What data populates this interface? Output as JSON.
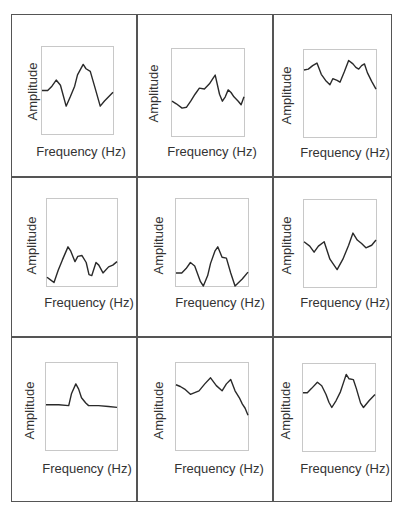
{
  "chart_data": [
    {
      "type": "line",
      "panel": "r1c1",
      "xlabel": "Frequency (Hz)",
      "ylabel": "Amplitude",
      "grid": false,
      "ticks": false,
      "points": [
        [
          0,
          50
        ],
        [
          8,
          50
        ],
        [
          14,
          45
        ],
        [
          20,
          38
        ],
        [
          26,
          44
        ],
        [
          34,
          68
        ],
        [
          40,
          57
        ],
        [
          46,
          45
        ],
        [
          50,
          32
        ],
        [
          58,
          20
        ],
        [
          62,
          25
        ],
        [
          68,
          28
        ],
        [
          74,
          45
        ],
        [
          82,
          68
        ],
        [
          88,
          62
        ],
        [
          100,
          52
        ]
      ]
    },
    {
      "type": "line",
      "panel": "r1c2",
      "xlabel": "Frequency (Hz)",
      "ylabel": "Amplitude",
      "grid": false,
      "ticks": false,
      "points": [
        [
          0,
          60
        ],
        [
          6,
          63
        ],
        [
          14,
          68
        ],
        [
          20,
          67
        ],
        [
          26,
          60
        ],
        [
          32,
          52
        ],
        [
          38,
          45
        ],
        [
          45,
          46
        ],
        [
          52,
          40
        ],
        [
          56,
          35
        ],
        [
          60,
          30
        ],
        [
          66,
          52
        ],
        [
          70,
          60
        ],
        [
          74,
          55
        ],
        [
          78,
          47
        ],
        [
          82,
          50
        ],
        [
          86,
          55
        ],
        [
          92,
          60
        ],
        [
          96,
          64
        ],
        [
          100,
          55
        ]
      ]
    },
    {
      "type": "line",
      "panel": "r1c3",
      "xlabel": "Frequency (Hz)",
      "ylabel": "Amplitude",
      "grid": false,
      "ticks": false,
      "points": [
        [
          0,
          23
        ],
        [
          6,
          22
        ],
        [
          12,
          18
        ],
        [
          18,
          15
        ],
        [
          24,
          28
        ],
        [
          30,
          35
        ],
        [
          36,
          40
        ],
        [
          40,
          33
        ],
        [
          46,
          35
        ],
        [
          50,
          37
        ],
        [
          56,
          25
        ],
        [
          62,
          12
        ],
        [
          68,
          16
        ],
        [
          72,
          20
        ],
        [
          76,
          22
        ],
        [
          80,
          18
        ],
        [
          84,
          16
        ],
        [
          88,
          26
        ],
        [
          94,
          36
        ],
        [
          100,
          45
        ]
      ]
    },
    {
      "type": "line",
      "panel": "r2c1",
      "xlabel": "Frequency (Hz)",
      "ylabel": "Amplitude",
      "grid": false,
      "ticks": false,
      "points": [
        [
          0,
          90
        ],
        [
          5,
          93
        ],
        [
          10,
          96
        ],
        [
          16,
          82
        ],
        [
          22,
          70
        ],
        [
          30,
          55
        ],
        [
          34,
          60
        ],
        [
          40,
          72
        ],
        [
          44,
          66
        ],
        [
          50,
          65
        ],
        [
          56,
          73
        ],
        [
          60,
          87
        ],
        [
          64,
          88
        ],
        [
          70,
          73
        ],
        [
          74,
          76
        ],
        [
          80,
          85
        ],
        [
          88,
          78
        ],
        [
          94,
          76
        ],
        [
          100,
          72
        ]
      ]
    },
    {
      "type": "line",
      "panel": "r2c2",
      "xlabel": "Frequency (Hz)",
      "ylabel": "Amplitude",
      "grid": false,
      "ticks": false,
      "points": [
        [
          0,
          85
        ],
        [
          8,
          85
        ],
        [
          14,
          80
        ],
        [
          20,
          73
        ],
        [
          26,
          77
        ],
        [
          34,
          95
        ],
        [
          38,
          100
        ],
        [
          44,
          88
        ],
        [
          48,
          74
        ],
        [
          54,
          60
        ],
        [
          58,
          55
        ],
        [
          64,
          67
        ],
        [
          70,
          68
        ],
        [
          76,
          85
        ],
        [
          82,
          100
        ],
        [
          92,
          92
        ],
        [
          100,
          84
        ]
      ]
    },
    {
      "type": "line",
      "panel": "r2c3",
      "xlabel": "Frequency (Hz)",
      "ylabel": "Amplitude",
      "grid": false,
      "ticks": false,
      "points": [
        [
          0,
          48
        ],
        [
          8,
          53
        ],
        [
          14,
          60
        ],
        [
          20,
          53
        ],
        [
          28,
          48
        ],
        [
          36,
          68
        ],
        [
          46,
          80
        ],
        [
          54,
          68
        ],
        [
          62,
          52
        ],
        [
          68,
          38
        ],
        [
          74,
          46
        ],
        [
          80,
          50
        ],
        [
          86,
          55
        ],
        [
          94,
          52
        ],
        [
          100,
          46
        ]
      ]
    },
    {
      "type": "line",
      "panel": "r3c1",
      "xlabel": "Frequency (Hz)",
      "ylabel": "Amplitude",
      "grid": false,
      "ticks": false,
      "points": [
        [
          0,
          48
        ],
        [
          18,
          48
        ],
        [
          32,
          49
        ],
        [
          36,
          35
        ],
        [
          42,
          24
        ],
        [
          46,
          30
        ],
        [
          50,
          40
        ],
        [
          56,
          46
        ],
        [
          60,
          49
        ],
        [
          74,
          49
        ],
        [
          88,
          50
        ],
        [
          100,
          51
        ]
      ]
    },
    {
      "type": "line",
      "panel": "r3c2",
      "xlabel": "Frequency (Hz)",
      "ylabel": "Amplitude",
      "grid": false,
      "ticks": false,
      "points": [
        [
          0,
          25
        ],
        [
          6,
          27
        ],
        [
          12,
          30
        ],
        [
          20,
          36
        ],
        [
          26,
          34
        ],
        [
          32,
          32
        ],
        [
          40,
          24
        ],
        [
          48,
          17
        ],
        [
          56,
          26
        ],
        [
          64,
          32
        ],
        [
          70,
          24
        ],
        [
          76,
          19
        ],
        [
          82,
          32
        ],
        [
          88,
          40
        ],
        [
          92,
          47
        ],
        [
          96,
          52
        ],
        [
          100,
          60
        ]
      ]
    },
    {
      "type": "line",
      "panel": "r3c3",
      "xlabel": "Frequency (Hz)",
      "ylabel": "Amplitude",
      "grid": false,
      "ticks": false,
      "points": [
        [
          0,
          33
        ],
        [
          6,
          33
        ],
        [
          12,
          28
        ],
        [
          20,
          21
        ],
        [
          26,
          25
        ],
        [
          32,
          35
        ],
        [
          36,
          44
        ],
        [
          40,
          50
        ],
        [
          46,
          42
        ],
        [
          52,
          32
        ],
        [
          56,
          22
        ],
        [
          60,
          12
        ],
        [
          64,
          17
        ],
        [
          70,
          18
        ],
        [
          74,
          28
        ],
        [
          80,
          45
        ],
        [
          84,
          50
        ],
        [
          92,
          42
        ],
        [
          100,
          35
        ]
      ]
    }
  ],
  "labels": {
    "x": "Frequency (Hz)",
    "y": "Amplitude"
  },
  "colors": {
    "line": "#2a2a2a",
    "plot_border": "#c8c8c8",
    "grid_border": "#555555"
  }
}
